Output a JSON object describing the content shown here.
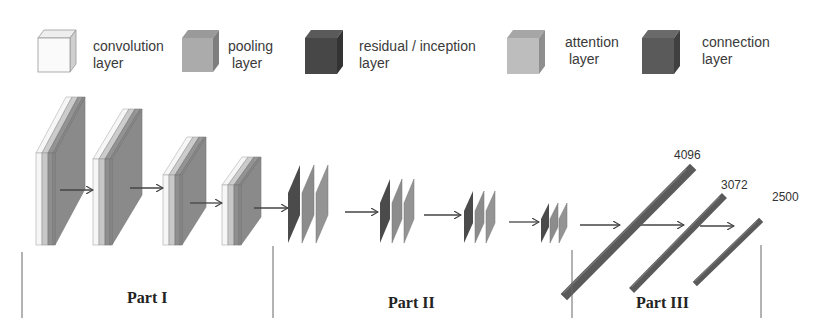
{
  "legend": [
    {
      "id": "convolution",
      "label": "convolution\nlayer",
      "color": "#f7f7f7",
      "side": "#cfcfcf",
      "top": "#e6e6e6"
    },
    {
      "id": "pooling",
      "label": "pooling\n layer",
      "color": "#a9a9a9",
      "side": "#8a8a8a",
      "top": "#9a9a9a"
    },
    {
      "id": "residual",
      "label": "residual / inception\nlayer",
      "color": "#4a4a4a",
      "side": "#3a3a3a",
      "top": "#555555"
    },
    {
      "id": "attention",
      "label": "attention\n layer",
      "color": "#bdbdbd",
      "side": "#9c9c9c",
      "top": "#a8a8a8"
    },
    {
      "id": "connection",
      "label": "connection\nlayer",
      "color": "#5c5c5c",
      "side": "#474747",
      "top": "#666666"
    }
  ],
  "fc_layers": [
    {
      "units": "4096"
    },
    {
      "units": "3072"
    },
    {
      "units": "2500"
    }
  ],
  "parts": [
    {
      "label": "Part I"
    },
    {
      "label": "Part II"
    },
    {
      "label": "Part III"
    }
  ],
  "colors": {
    "conv": "#f6f6f6",
    "attention": "#c8c8c8",
    "pool": "#8e8e8e",
    "residual": "#4b4b4b",
    "fc": "#5a5a5a",
    "arrow": "#444444",
    "divider": "#555555"
  }
}
